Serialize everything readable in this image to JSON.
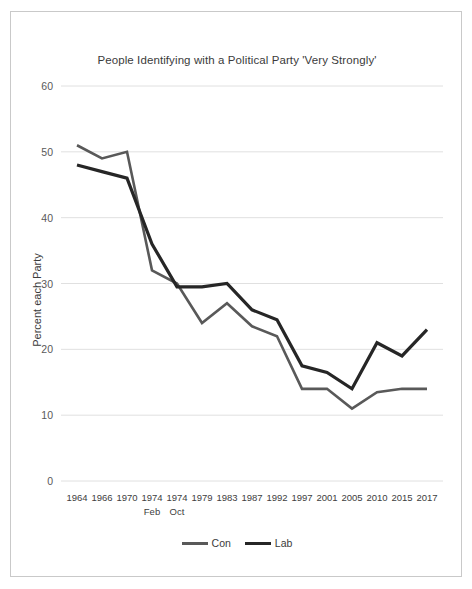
{
  "chart_data": {
    "type": "line",
    "title": "People Identifying with a Political Party 'Very Strongly'",
    "xlabel": "",
    "ylabel": "Percent each Party",
    "categories": [
      "1964",
      "1966",
      "1970",
      "1974 Feb",
      "1974 Oct",
      "1979",
      "1983",
      "1987",
      "1992",
      "1997",
      "2001",
      "2005",
      "2010",
      "2015",
      "2017"
    ],
    "x_tick_lines": [
      [
        "1964",
        ""
      ],
      [
        "1966",
        ""
      ],
      [
        "1970",
        ""
      ],
      [
        "1974",
        "Feb"
      ],
      [
        "1974",
        "Oct"
      ],
      [
        "1979",
        ""
      ],
      [
        "1983",
        ""
      ],
      [
        "1987",
        ""
      ],
      [
        "1992",
        ""
      ],
      [
        "1997",
        ""
      ],
      [
        "2001",
        ""
      ],
      [
        "2005",
        ""
      ],
      [
        "2010",
        ""
      ],
      [
        "2015",
        ""
      ],
      [
        "2017",
        ""
      ]
    ],
    "series": [
      {
        "name": "Con",
        "color": "#595959",
        "values": [
          51,
          49,
          50,
          32,
          30,
          24,
          27,
          23.5,
          22,
          14,
          14,
          11,
          13.5,
          14,
          14
        ]
      },
      {
        "name": "Lab",
        "color": "#262626",
        "values": [
          48,
          47,
          46,
          36,
          29.5,
          29.5,
          30,
          26,
          24.5,
          17.5,
          16.5,
          14,
          21,
          19,
          23
        ]
      }
    ],
    "ylim": [
      0,
      60
    ],
    "y_ticks": [
      0,
      10,
      20,
      30,
      40,
      50,
      60
    ],
    "grid": true,
    "legend_position": "bottom",
    "legend_entries": [
      "Con",
      "Lab"
    ]
  }
}
